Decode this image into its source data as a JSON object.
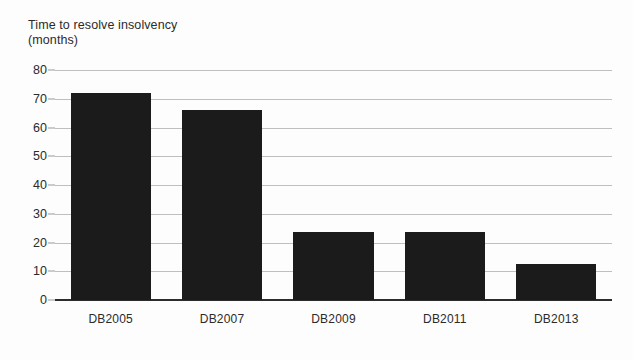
{
  "chart_data": {
    "type": "bar",
    "title": "Time to resolve insolvency (months)",
    "title_lines": [
      "Time to resolve insolvency",
      "(months)"
    ],
    "xlabel": "",
    "ylabel": "",
    "categories": [
      "DB2005",
      "DB2007",
      "DB2009",
      "DB2011",
      "DB2013"
    ],
    "values": [
      72,
      66,
      23.5,
      23.5,
      12.5
    ],
    "ylim": [
      0,
      80
    ],
    "ytick_step": 10,
    "yticks": [
      0,
      10,
      20,
      30,
      40,
      50,
      60,
      70,
      80
    ],
    "ytick_labels": [
      "0",
      "10",
      "20",
      "30",
      "40",
      "50",
      "60",
      "70",
      "80"
    ],
    "grid": true,
    "grid_axis": "y",
    "legend": false,
    "bar_color": "#1b1b1b",
    "gridline_color": "#b4b4b4",
    "axis_color": "#2c2c2c",
    "background_color": "#fdfdfd",
    "text_color": "#2b2b2b"
  }
}
